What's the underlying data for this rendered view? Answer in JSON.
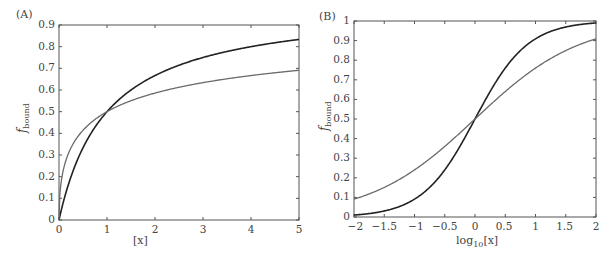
{
  "chart_data": [
    {
      "panel": "(A)",
      "type": "line",
      "title": "",
      "xlabel": "[x]",
      "ylabel": "f_bound",
      "xlim": [
        0,
        5
      ],
      "ylim": [
        0,
        0.9
      ],
      "xticks": [
        "0",
        "1",
        "2",
        "3",
        "4",
        "5"
      ],
      "yticks": [
        "0",
        "0.1",
        "0.2",
        "0.3",
        "0.4",
        "0.5",
        "0.6",
        "0.7",
        "0.8",
        "0.9"
      ],
      "grid": false,
      "legend": null,
      "x": [
        0,
        0.05,
        0.1,
        0.25,
        0.5,
        1,
        1.5,
        2,
        2.5,
        3,
        3.5,
        4,
        4.5,
        5
      ],
      "series": [
        {
          "name": "black curve (n = 1)",
          "color": "#222222",
          "values": [
            0,
            0.048,
            0.091,
            0.2,
            0.333,
            0.5,
            0.6,
            0.667,
            0.714,
            0.75,
            0.778,
            0.8,
            0.818,
            0.833
          ]
        },
        {
          "name": "gray curve (n = 0.5)",
          "color": "#6a6a6a",
          "values": [
            0,
            0.183,
            0.24,
            0.333,
            0.414,
            0.5,
            0.55,
            0.586,
            0.613,
            0.634,
            0.652,
            0.667,
            0.68,
            0.691
          ]
        }
      ]
    },
    {
      "panel": "(B)",
      "type": "line",
      "title": "",
      "xlabel": "log10[x]",
      "ylabel": "f_bound",
      "xlim": [
        -2,
        2
      ],
      "ylim": [
        0,
        1
      ],
      "xticks": [
        "−2",
        "−1.5",
        "−1",
        "−0.5",
        "0",
        "0.5",
        "1",
        "1.5",
        "2"
      ],
      "yticks": [
        "0",
        "0.1",
        "0.2",
        "0.3",
        "0.4",
        "0.5",
        "0.6",
        "0.7",
        "0.8",
        "0.9",
        "1"
      ],
      "grid": false,
      "legend": null,
      "x": [
        -2,
        -1.5,
        -1,
        -0.5,
        0,
        0.5,
        1,
        1.5,
        2
      ],
      "series": [
        {
          "name": "black curve (n = 1)",
          "color": "#222222",
          "values": [
            0.01,
            0.031,
            0.091,
            0.24,
            0.5,
            0.76,
            0.909,
            0.969,
            0.99
          ]
        },
        {
          "name": "gray curve (n = 0.5)",
          "color": "#6a6a6a",
          "values": [
            0.091,
            0.151,
            0.24,
            0.36,
            0.5,
            0.64,
            0.76,
            0.849,
            0.909
          ]
        }
      ]
    }
  ],
  "labels": {
    "panel_a": "(A)",
    "panel_b": "(B)",
    "a_xlabel": "[x]",
    "b_xlabel_main": "log",
    "b_xlabel_sub": "10",
    "b_xlabel_tail": "[x]",
    "ylabel_main": "f",
    "ylabel_sub": "bound"
  }
}
